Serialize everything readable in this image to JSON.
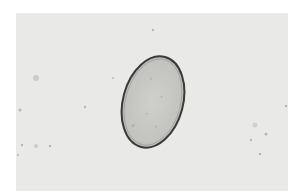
{
  "image": {
    "subject": "oval egg under light microscopy",
    "background_color": "#e9e9e7",
    "egg": {
      "fill": "#c4c4c0",
      "outline": "#3a3a38"
    }
  }
}
